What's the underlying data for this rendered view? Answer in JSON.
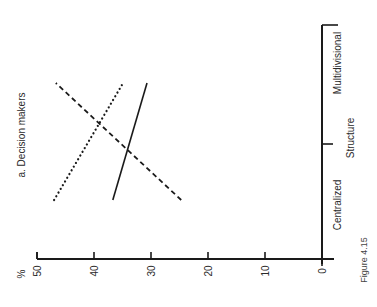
{
  "figure_label": "Figure 4.15",
  "chart_data": {
    "type": "line",
    "title": "a. Decision makers",
    "xlabel": "Structure",
    "ylabel": "%",
    "categories": [
      "Centralized",
      "Multidivisional"
    ],
    "yticks": [
      0,
      10,
      20,
      30,
      40,
      50
    ],
    "ylim": [
      0,
      50
    ],
    "grid": false,
    "legend": null,
    "orientation_note": "figure printed rotated 90° counter-clockwise",
    "series": [
      {
        "name": "dashed",
        "style": "dashed",
        "values": [
          24.7,
          46.7
        ]
      },
      {
        "name": "dotted",
        "style": "dotted",
        "values": [
          47.0,
          34.9
        ]
      },
      {
        "name": "solid",
        "style": "solid",
        "values": [
          36.7,
          30.7
        ]
      }
    ]
  }
}
